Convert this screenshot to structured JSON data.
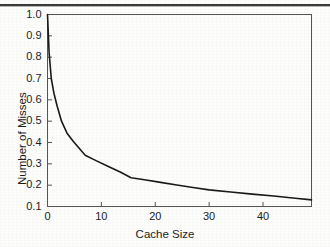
{
  "chart_data": {
    "type": "line",
    "title": "",
    "xlabel": "Cache Size",
    "ylabel": "Number of Misses",
    "xlim": [
      0,
      49
    ],
    "ylim": [
      0.1,
      1.0
    ],
    "xticks": [
      0,
      10,
      20,
      30,
      40
    ],
    "xtick_labels": [
      "0",
      "10",
      "20",
      "30",
      "40"
    ],
    "yticks": [
      0.1,
      0.2,
      0.3,
      0.4,
      0.5,
      0.6,
      0.7,
      0.8,
      0.9,
      1.0
    ],
    "ytick_labels": [
      "0.1",
      "0.2",
      "0.3",
      "0.4",
      "0.5",
      "0.6",
      "0.7",
      "0.8",
      "0.9",
      "1.0"
    ],
    "grid": false,
    "legend": "none",
    "line_color": "#1a1a1a",
    "line_width": 1.6,
    "frame_color": "#555555",
    "series": [
      {
        "name": "misses",
        "x": [
          0,
          0.3,
          0.7,
          1.2,
          1.8,
          2.6,
          3.6,
          4.8,
          7.0,
          9.0,
          11.5,
          13.5,
          15.5,
          18.0,
          21.0,
          24.0,
          27.0,
          30.0,
          34.0,
          38.0,
          42.0,
          46.0,
          49.0
        ],
        "y": [
          1.0,
          0.82,
          0.7,
          0.63,
          0.57,
          0.5,
          0.445,
          0.405,
          0.34,
          0.315,
          0.285,
          0.262,
          0.235,
          0.225,
          0.213,
          0.201,
          0.189,
          0.178,
          0.168,
          0.158,
          0.149,
          0.139,
          0.131
        ]
      }
    ]
  },
  "figure": {
    "caption": "",
    "page_rule_color": "#3a3a3a"
  }
}
